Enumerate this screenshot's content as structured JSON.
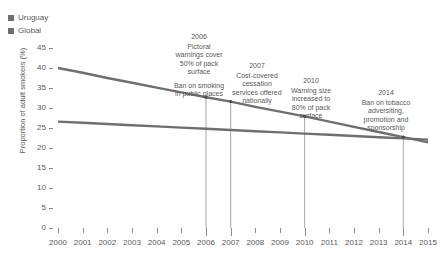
{
  "legend": {
    "position": "top-left",
    "items": [
      {
        "label": "Uruguay",
        "color": "#6e6f71"
      },
      {
        "label": "Global",
        "color": "#6e6f71"
      }
    ]
  },
  "axes": {
    "ylabel": "Proportion of adult smokers (%)",
    "xlabel": "",
    "yticks": [
      "0",
      "5",
      "10",
      "15",
      "20",
      "25",
      "30",
      "35",
      "40",
      "45"
    ],
    "xticks": [
      "2000",
      "2001",
      "2002",
      "2003",
      "2004",
      "2005",
      "2006",
      "2007",
      "2008",
      "2009",
      "2010",
      "2011",
      "2012",
      "2013",
      "2014",
      "2015"
    ]
  },
  "annotations": [
    {
      "year": "2006",
      "line1": "Pictoral<br>warnings cover<br>50% of pack<br>surface",
      "line2": "Ban on smoking<br>in public places"
    },
    {
      "year": "2007",
      "line1": "Cost-covered<br>cessation<br>services offered<br>nationally",
      "line2": ""
    },
    {
      "year": "2010",
      "line1": "Warning size<br>increased to<br>80% of pack<br>surface",
      "line2": ""
    },
    {
      "year": "2014",
      "line1": "Ban on tobacco<br>adversiting,<br>promotion and<br>sponsorship",
      "line2": ""
    }
  ],
  "chart_data": {
    "type": "line",
    "title": "",
    "xlabel": "",
    "ylabel": "Proportion of adult smokers (%)",
    "x": [
      2000,
      2001,
      2002,
      2003,
      2004,
      2005,
      2006,
      2007,
      2008,
      2009,
      2010,
      2011,
      2012,
      2013,
      2014,
      2015
    ],
    "xlim": [
      2000,
      2015
    ],
    "ylim": [
      0,
      45
    ],
    "grid": false,
    "legend_position": "top-left",
    "series": [
      {
        "name": "Uruguay",
        "color": "#6e6f71",
        "values": [
          40.0,
          38.8,
          37.5,
          36.3,
          35.1,
          33.9,
          32.7,
          31.6,
          30.3,
          29.1,
          27.9,
          26.6,
          25.3,
          24.0,
          22.7,
          21.4
        ]
      },
      {
        "name": "Global",
        "color": "#6e6f71",
        "values": [
          26.6,
          26.3,
          26.0,
          25.7,
          25.4,
          25.1,
          24.8,
          24.5,
          24.2,
          23.9,
          23.6,
          23.3,
          23.0,
          22.7,
          22.4,
          22.1
        ]
      }
    ],
    "event_markers": [
      {
        "year": 2006,
        "value": 32.7
      },
      {
        "year": 2007,
        "value": 31.6
      },
      {
        "year": 2010,
        "value": 27.9
      },
      {
        "year": 2014,
        "value": 22.7
      }
    ]
  },
  "colors": {
    "series": "#6e6f71",
    "text": "#58595b",
    "tick": "#8a8c8e",
    "annotation_line": "#9a9c9e",
    "background": "#ffffff"
  }
}
